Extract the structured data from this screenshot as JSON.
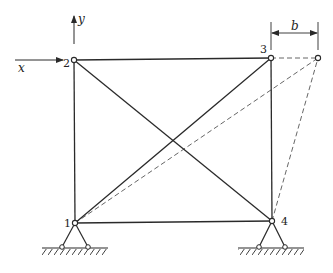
{
  "figure": {
    "type": "plane truss with pin supports",
    "axes": {
      "x_label": "x",
      "y_label": "y"
    },
    "nodes": [
      {
        "id": "1",
        "label": "1",
        "x": 75,
        "y": 223
      },
      {
        "id": "2",
        "label": "2",
        "x": 74,
        "y": 60
      },
      {
        "id": "3",
        "label": "3",
        "x": 271,
        "y": 58
      },
      {
        "id": "4",
        "label": "4",
        "x": 272,
        "y": 221
      }
    ],
    "displaced_node": {
      "id": "3'",
      "x": 318,
      "y": 58
    },
    "members": [
      {
        "from": "1",
        "to": "2"
      },
      {
        "from": "2",
        "to": "3"
      },
      {
        "from": "3",
        "to": "4"
      },
      {
        "from": "1",
        "to": "4"
      },
      {
        "from": "2",
        "to": "4"
      },
      {
        "from": "1",
        "to": "3"
      }
    ],
    "displaced_members": [
      {
        "from": "3",
        "to": "3'"
      },
      {
        "from": "1",
        "to": "3'"
      },
      {
        "from": "4",
        "to": "3'"
      }
    ],
    "dimension": {
      "label": "b",
      "description": "horizontal displacement of node 3"
    },
    "supports": [
      {
        "at": "1",
        "type": "pinned"
      },
      {
        "at": "4",
        "type": "pinned"
      }
    ],
    "colors": {
      "line": "#2a2a2a",
      "dashed": "#555555",
      "background": "#ffffff"
    }
  }
}
